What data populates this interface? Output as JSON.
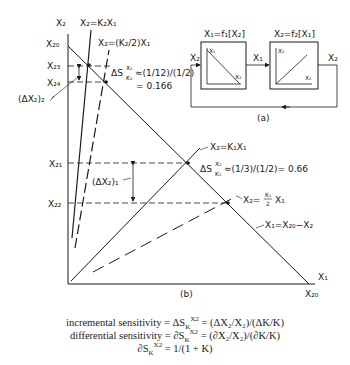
{
  "figure": {
    "panel_a": {
      "caption": "(a)",
      "block1": {
        "title": "X₁=f₁[X₂]",
        "y_axis": "X₁",
        "x_axis": "X₂",
        "curve": "decreasing"
      },
      "block2": {
        "title": "X₂=f₂[X₁]",
        "y_axis": "X₂",
        "x_axis": "X₁",
        "curve": "increasing"
      },
      "signals": {
        "input_left": "X₂",
        "between": "X₁",
        "output_right": "X₂"
      }
    },
    "panel_b": {
      "caption": "(b)",
      "axis_y": "X₂",
      "axis_x": "X₁",
      "y_ticks": [
        "X₂₀",
        "X₂₃",
        "X₂₄",
        "X₂₁",
        "X₂₂"
      ],
      "x_tick": "X₂₀",
      "lines": {
        "k2": "X₂=K₂X₁",
        "k2_half": "X₂=(K₂/2)X₁",
        "k1": "X₂=K₁X₁",
        "k1_half_num": "K₁",
        "k1_half_den": "2",
        "k1_half_pre": "X₂=",
        "k1_half_post": "X₁",
        "load": "X₁=X₂₀−X₂"
      },
      "annotations": {
        "delta2": "(ΔX₂)₂",
        "delta1": "(ΔX₂)₁",
        "sens_k2_line1": "≈(1/12)/(1/2)",
        "sens_k2_line2": "= 0.166",
        "sens_k1": "≈(1/3)/(1/2)= 0.66",
        "sens_prefix": "ΔS",
        "sens_sup": "X₂",
        "sens_sub_k2": "K₂",
        "sens_sub_k1": "K₁"
      }
    },
    "equations": {
      "incremental": {
        "label": "incremental sensitivity",
        "mid": "= ΔS",
        "rhs": "= (ΔX₂/X₂)/(ΔK/K)"
      },
      "differential": {
        "label": "differential sensitivity",
        "mid": "= ∂S",
        "rhs": "= (∂X₂/X₂)/(∂K/K)"
      },
      "result": {
        "lhs": "∂S",
        "rhs": "= 1/(1 + K)"
      },
      "sub_k": "K",
      "sup_x2": "X2"
    }
  }
}
